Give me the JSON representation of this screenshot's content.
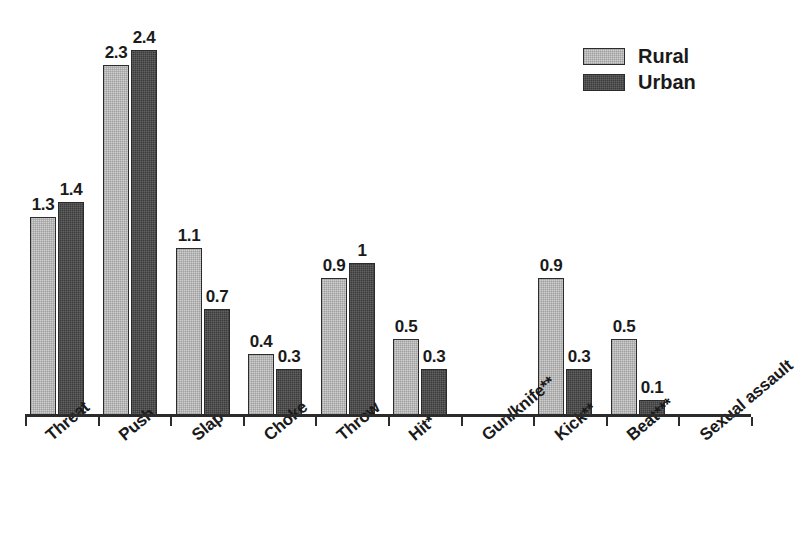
{
  "chart_data": {
    "type": "bar",
    "title": "",
    "subtitle": "",
    "xlabel": "",
    "ylabel": "",
    "ylim": [
      0,
      2.6
    ],
    "grid": false,
    "legend_position": "top-right",
    "categories": [
      "Threat",
      "Push",
      "Slap",
      "Choke",
      "Throw",
      "Hit*",
      "Gun/knife**",
      "Kick**",
      "Beat***",
      "Sexual assault"
    ],
    "series": [
      {
        "name": "Rural",
        "color": "#cfcfcf",
        "values": [
          1.3,
          2.3,
          1.1,
          0.4,
          0.9,
          0.5,
          0,
          0.9,
          0.5,
          0
        ],
        "labels": [
          "1.3",
          "2.3",
          "1.1",
          "0.4",
          "0.9",
          "0.5",
          "",
          "0.9",
          "0.5",
          ""
        ]
      },
      {
        "name": "Urban",
        "color": "#3b3b3b",
        "values": [
          1.4,
          2.4,
          0.7,
          0.3,
          1.0,
          0.3,
          0,
          0.3,
          0.1,
          0
        ],
        "labels": [
          "1.4",
          "2.4",
          "0.7",
          "0.3",
          "1",
          "0.3",
          "",
          "0.3",
          "0.1",
          ""
        ]
      }
    ],
    "annotations": []
  },
  "legend": {
    "items": [
      {
        "label": "Rural",
        "swatch": "rural-swatch"
      },
      {
        "label": "Urban",
        "swatch": "urban-swatch"
      }
    ]
  },
  "axis": {
    "baseline_name": "x-axis-line",
    "tick_count": 10
  }
}
